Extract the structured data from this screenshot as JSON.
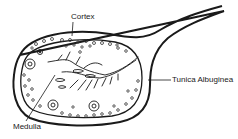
{
  "diagram": {
    "labels": {
      "cortex": "Cortex",
      "tunica_albuginea": "Tunica Albuginea",
      "medulla": "Medulla"
    },
    "colors": {
      "stroke": "#1a1a1a",
      "background": "#ffffff"
    }
  }
}
